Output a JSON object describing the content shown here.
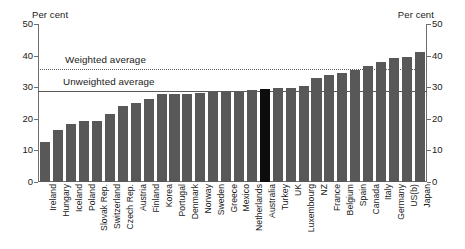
{
  "axis": {
    "unit_label_left": "Per cent",
    "unit_label_right": "Per cent",
    "ticks": [
      "0",
      "10",
      "20",
      "30",
      "40",
      "50"
    ]
  },
  "annotations": {
    "weighted_label": "Weighted average",
    "unweighted_label": "Unweighted average"
  },
  "colors": {
    "bar": "#585858",
    "bar_highlight": "#0d0d0d",
    "axis": "#6f6f6f",
    "reference_line": "#5a5a5a"
  },
  "chart_data": {
    "type": "bar",
    "title": "",
    "subtitle": "",
    "xlabel": "",
    "ylabel": "Per cent",
    "ylim": [
      0,
      50
    ],
    "ytick_values": [
      0,
      10,
      20,
      30,
      40,
      50
    ],
    "grid": false,
    "legend_position": "none",
    "highlight_category": "Australia",
    "categories": [
      "Ireland",
      "Hungary",
      "Iceland",
      "Poland",
      "Slovak Rep.",
      "Switzerland",
      "Czech Rep.",
      "Austria",
      "Finland",
      "Korea",
      "Portugal",
      "Denmark",
      "Norway",
      "Sweden",
      "Greece",
      "Mexico",
      "Netherlands",
      "Australia",
      "Turkey",
      "UK",
      "Luxembourg",
      "NZ",
      "France",
      "Belgium",
      "Spain",
      "Canada",
      "Italy",
      "Germany",
      "US(b)",
      "Japan"
    ],
    "values": [
      12.8,
      16.5,
      18.3,
      19.2,
      19.2,
      21.4,
      24.2,
      25.0,
      26.3,
      27.7,
      27.9,
      27.9,
      28.3,
      28.4,
      28.5,
      28.6,
      29.1,
      29.5,
      29.7,
      29.7,
      30.4,
      32.8,
      34.0,
      34.4,
      35.6,
      36.6,
      38.0,
      39.3,
      39.5,
      41.1
    ],
    "reference_lines": [
      {
        "name": "Weighted average",
        "value": 35.8,
        "style": "dotted"
      },
      {
        "name": "Unweighted average",
        "value": 28.8,
        "style": "solid"
      }
    ]
  }
}
